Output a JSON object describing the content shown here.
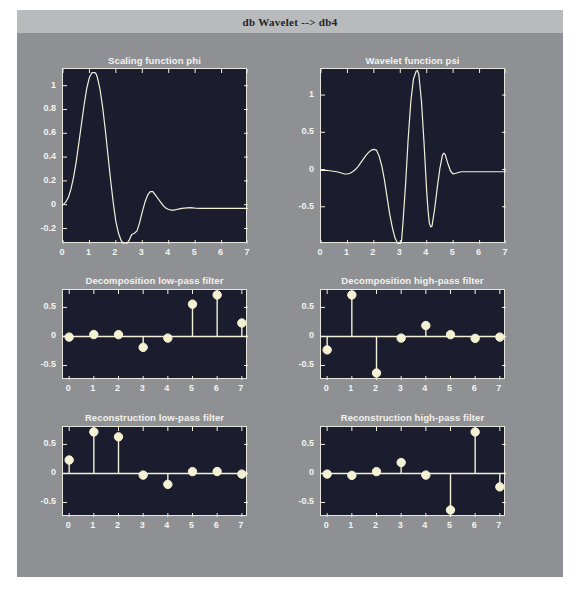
{
  "window": {
    "title": "db Wavelet --> db4",
    "bg_color": "#8e9093",
    "titlebar_color": "#b9babb",
    "axes_bg_color": "#1b1d2e",
    "line_color": "#f2f0d8",
    "marker_color": "#f4f2d2"
  },
  "chart_data": [
    {
      "id": "scaling-function-phi",
      "type": "line",
      "title": "Scaling function phi",
      "xlabel": "",
      "ylabel": "",
      "xlim": [
        0,
        7
      ],
      "ylim": [
        -0.33,
        1.14
      ],
      "xticks": [
        0,
        1,
        2,
        3,
        4,
        5,
        6,
        7
      ],
      "xticklabels": [
        "0",
        "1",
        "2",
        "3",
        "4",
        "5",
        "6",
        "7"
      ],
      "yticks": [
        -0.2,
        0,
        0.2,
        0.4,
        0.6,
        0.8,
        1
      ],
      "yticklabels": [
        "-0.2",
        "0",
        "0.2",
        "0.4",
        "0.6",
        "0.8",
        "1"
      ],
      "grid": false,
      "legend": null,
      "x": [
        0.0,
        0.1,
        0.2,
        0.3,
        0.4,
        0.5,
        0.6,
        0.7,
        0.8,
        0.9,
        1.0,
        1.1,
        1.2,
        1.25,
        1.3,
        1.4,
        1.5,
        1.6,
        1.7,
        1.8,
        1.9,
        2.0,
        2.1,
        2.2,
        2.3,
        2.4,
        2.5,
        2.6,
        2.7,
        2.8,
        2.9,
        3.0,
        3.1,
        3.2,
        3.3,
        3.4,
        3.5,
        3.6,
        3.7,
        3.8,
        3.9,
        4.0,
        4.1,
        4.2,
        4.3,
        4.4,
        4.5,
        4.6,
        4.7,
        4.8,
        4.9,
        5.0,
        5.2,
        5.4,
        5.6,
        5.8,
        6.0,
        6.3,
        6.6,
        7.0
      ],
      "y": [
        0.0,
        0.02,
        0.06,
        0.13,
        0.23,
        0.36,
        0.52,
        0.68,
        0.84,
        0.98,
        1.07,
        1.11,
        1.11,
        1.1,
        1.07,
        0.97,
        0.82,
        0.63,
        0.42,
        0.21,
        0.02,
        -0.14,
        -0.24,
        -0.3,
        -0.33,
        -0.33,
        -0.3,
        -0.25,
        -0.24,
        -0.22,
        -0.15,
        -0.06,
        0.02,
        0.08,
        0.11,
        0.11,
        0.08,
        0.05,
        0.02,
        -0.01,
        -0.03,
        -0.04,
        -0.045,
        -0.045,
        -0.04,
        -0.035,
        -0.03,
        -0.028,
        -0.026,
        -0.025,
        -0.026,
        -0.028,
        -0.03,
        -0.03,
        -0.03,
        -0.03,
        -0.03,
        -0.03,
        -0.03,
        -0.03
      ]
    },
    {
      "id": "wavelet-function-psi",
      "type": "line",
      "title": "Wavelet function psi",
      "xlabel": "",
      "ylabel": "",
      "xlim": [
        0,
        7
      ],
      "ylim": [
        -1.0,
        1.35
      ],
      "xticks": [
        0,
        1,
        2,
        3,
        4,
        5,
        6,
        7
      ],
      "xticklabels": [
        "0",
        "1",
        "2",
        "3",
        "4",
        "5",
        "6",
        "7"
      ],
      "yticks": [
        -0.5,
        0,
        0.5,
        1
      ],
      "yticklabels": [
        "-0.5",
        "0",
        "0.5",
        "1"
      ],
      "grid": false,
      "legend": null,
      "x": [
        0.0,
        0.2,
        0.4,
        0.6,
        0.8,
        0.9,
        1.0,
        1.1,
        1.2,
        1.3,
        1.4,
        1.5,
        1.6,
        1.7,
        1.8,
        1.9,
        2.0,
        2.1,
        2.2,
        2.3,
        2.4,
        2.5,
        2.6,
        2.7,
        2.8,
        2.9,
        3.0,
        3.05,
        3.1,
        3.2,
        3.3,
        3.4,
        3.5,
        3.6,
        3.65,
        3.7,
        3.8,
        3.9,
        4.0,
        4.05,
        4.1,
        4.15,
        4.2,
        4.3,
        4.4,
        4.5,
        4.6,
        4.65,
        4.7,
        4.8,
        4.9,
        5.0,
        5.1,
        5.2,
        5.3,
        5.4,
        5.6,
        5.8,
        6.0,
        6.4,
        7.0
      ],
      "y": [
        -0.01,
        -0.01,
        -0.02,
        -0.03,
        -0.05,
        -0.06,
        -0.06,
        -0.05,
        -0.03,
        0.0,
        0.04,
        0.09,
        0.14,
        0.19,
        0.23,
        0.26,
        0.27,
        0.26,
        0.18,
        0.05,
        -0.14,
        -0.37,
        -0.6,
        -0.78,
        -0.92,
        -0.99,
        -1.0,
        -0.95,
        -0.72,
        -0.2,
        0.42,
        0.92,
        1.22,
        1.32,
        1.33,
        1.28,
        0.92,
        0.35,
        -0.3,
        -0.55,
        -0.72,
        -0.77,
        -0.76,
        -0.53,
        -0.24,
        0.02,
        0.2,
        0.22,
        0.2,
        0.08,
        -0.02,
        -0.06,
        -0.05,
        -0.04,
        -0.03,
        -0.03,
        -0.03,
        -0.03,
        -0.03,
        -0.03,
        -0.03
      ]
    },
    {
      "id": "decomposition-low-pass-filter",
      "type": "stem",
      "title": "Decomposition low-pass filter",
      "xlabel": "",
      "ylabel": "",
      "xlim": [
        -0.25,
        7.25
      ],
      "ylim": [
        -0.75,
        0.8
      ],
      "xticks": [
        0,
        1,
        2,
        3,
        4,
        5,
        6,
        7
      ],
      "xticklabels": [
        "0",
        "1",
        "2",
        "3",
        "4",
        "5",
        "6",
        "7"
      ],
      "yticks": [
        -0.5,
        0,
        0.5
      ],
      "yticklabels": [
        "-0.5",
        "0",
        "0.5"
      ],
      "grid": false,
      "legend": null,
      "categories": [
        0,
        1,
        2,
        3,
        4,
        5,
        6,
        7
      ],
      "values": [
        -0.011,
        0.033,
        0.031,
        -0.188,
        -0.028,
        0.556,
        0.715,
        0.231
      ]
    },
    {
      "id": "decomposition-high-pass-filter",
      "type": "stem",
      "title": "Decomposition high-pass filter",
      "xlabel": "",
      "ylabel": "",
      "xlim": [
        -0.25,
        7.25
      ],
      "ylim": [
        -0.75,
        0.8
      ],
      "xticks": [
        0,
        1,
        2,
        3,
        4,
        5,
        6,
        7
      ],
      "xticklabels": [
        "0",
        "1",
        "2",
        "3",
        "4",
        "5",
        "6",
        "7"
      ],
      "yticks": [
        -0.5,
        0,
        0.5
      ],
      "yticklabels": [
        "-0.5",
        "0",
        "0.5"
      ],
      "grid": false,
      "legend": null,
      "categories": [
        0,
        1,
        2,
        3,
        4,
        5,
        6,
        7
      ],
      "values": [
        -0.231,
        0.715,
        -0.63,
        -0.028,
        0.188,
        0.031,
        -0.033,
        -0.011
      ]
    },
    {
      "id": "reconstruction-low-pass-filter",
      "type": "stem",
      "title": "Reconstruction low-pass filter",
      "xlabel": "",
      "ylabel": "",
      "xlim": [
        -0.25,
        7.25
      ],
      "ylim": [
        -0.75,
        0.8
      ],
      "xticks": [
        0,
        1,
        2,
        3,
        4,
        5,
        6,
        7
      ],
      "xticklabels": [
        "0",
        "1",
        "2",
        "3",
        "4",
        "5",
        "6",
        "7"
      ],
      "yticks": [
        -0.5,
        0,
        0.5
      ],
      "yticklabels": [
        "-0.5",
        "0",
        "0.5"
      ],
      "grid": false,
      "legend": null,
      "categories": [
        0,
        1,
        2,
        3,
        4,
        5,
        6,
        7
      ],
      "values": [
        0.231,
        0.715,
        0.63,
        -0.028,
        -0.188,
        0.031,
        0.033,
        -0.011
      ]
    },
    {
      "id": "reconstruction-high-pass-filter",
      "type": "stem",
      "title": "Reconstruction high-pass filter",
      "xlabel": "",
      "ylabel": "",
      "xlim": [
        -0.25,
        7.25
      ],
      "ylim": [
        -0.75,
        0.8
      ],
      "xticks": [
        0,
        1,
        2,
        3,
        4,
        5,
        6,
        7
      ],
      "xticklabels": [
        "0",
        "1",
        "2",
        "3",
        "4",
        "5",
        "6",
        "7"
      ],
      "yticks": [
        -0.5,
        0,
        0.5
      ],
      "yticklabels": [
        "-0.5",
        "0",
        "0.5"
      ],
      "grid": false,
      "legend": null,
      "categories": [
        0,
        1,
        2,
        3,
        4,
        5,
        6,
        7
      ],
      "values": [
        -0.011,
        -0.033,
        0.031,
        0.188,
        -0.028,
        -0.63,
        0.715,
        -0.231
      ]
    }
  ],
  "panel_geometry": [
    {
      "title_top": 22,
      "left": 45,
      "top": 35,
      "width": 185,
      "height": 175,
      "title_left": 45,
      "title_width": 185
    },
    {
      "title_top": 22,
      "left": 303,
      "top": 35,
      "width": 185,
      "height": 175,
      "title_left": 303,
      "title_width": 185
    },
    {
      "title_top": 242,
      "left": 45,
      "top": 256,
      "width": 185,
      "height": 90,
      "title_left": 45,
      "title_width": 185
    },
    {
      "title_top": 242,
      "left": 303,
      "top": 256,
      "width": 185,
      "height": 90,
      "title_left": 303,
      "title_width": 185
    },
    {
      "title_top": 379,
      "left": 45,
      "top": 393,
      "width": 185,
      "height": 90,
      "title_left": 45,
      "title_width": 185
    },
    {
      "title_top": 379,
      "left": 303,
      "top": 393,
      "width": 185,
      "height": 90,
      "title_left": 303,
      "title_width": 185
    }
  ]
}
